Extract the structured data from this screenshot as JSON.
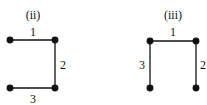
{
  "diagrams": [
    {
      "title": "(ii)",
      "edges": [
        {
          "label": "1",
          "from": "top-left",
          "to": "top-right"
        },
        {
          "label": "2",
          "from": "top-right",
          "to": "bottom-right"
        },
        {
          "label": "3",
          "from": "bottom-left",
          "to": "bottom-right"
        }
      ]
    },
    {
      "title": "(iii)",
      "edges": [
        {
          "label": "1",
          "from": "top-left",
          "to": "top-right"
        },
        {
          "label": "2",
          "from": "top-right",
          "to": "bottom-right"
        },
        {
          "label": "3",
          "from": "top-left",
          "to": "bottom-left"
        }
      ]
    }
  ]
}
